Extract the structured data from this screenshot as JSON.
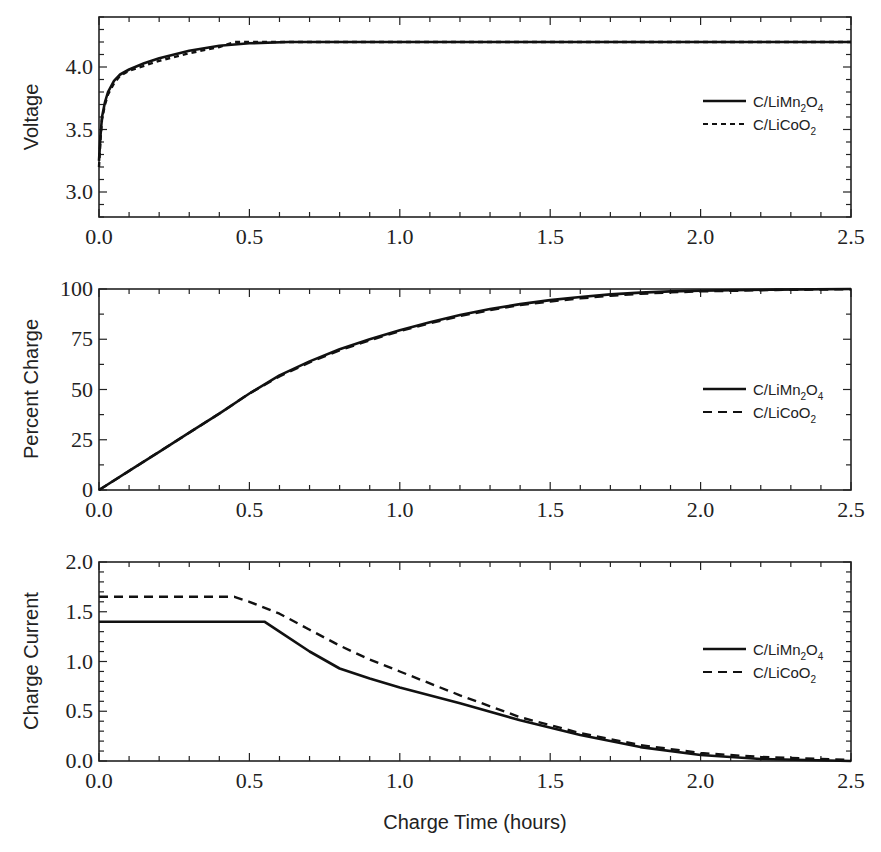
{
  "chart_data": [
    {
      "type": "line",
      "title": "",
      "xlabel": "",
      "ylabel": "Voltage",
      "xlim": [
        0,
        2.5
      ],
      "ylim": [
        2.8,
        4.4
      ],
      "xticks": [
        "0.0",
        "0.5",
        "1.0",
        "1.5",
        "2.0",
        "2.5"
      ],
      "yticks": [
        "3.0",
        "3.5",
        "4.0"
      ],
      "legend_position": "right-center",
      "series": [
        {
          "name": "C/LiMn2O4",
          "style": "solid",
          "x": [
            0,
            0.005,
            0.01,
            0.02,
            0.03,
            0.05,
            0.07,
            0.1,
            0.15,
            0.2,
            0.3,
            0.4,
            0.5,
            0.63,
            1.0,
            1.5,
            2.0,
            2.5
          ],
          "y": [
            3.25,
            3.45,
            3.6,
            3.72,
            3.8,
            3.89,
            3.94,
            3.98,
            4.03,
            4.07,
            4.13,
            4.17,
            4.19,
            4.2,
            4.2,
            4.2,
            4.2,
            4.2
          ]
        },
        {
          "name": "C/LiCoO2",
          "style": "dashed",
          "x": [
            0,
            0.005,
            0.01,
            0.02,
            0.03,
            0.05,
            0.07,
            0.1,
            0.15,
            0.2,
            0.3,
            0.4,
            0.45,
            0.5,
            1.0,
            1.5,
            2.0,
            2.5
          ],
          "y": [
            3.2,
            3.42,
            3.58,
            3.7,
            3.78,
            3.87,
            3.93,
            3.97,
            4.01,
            4.05,
            4.11,
            4.16,
            4.2,
            4.2,
            4.2,
            4.2,
            4.2,
            4.2
          ]
        }
      ]
    },
    {
      "type": "line",
      "title": "",
      "xlabel": "",
      "ylabel": "Percent Charge",
      "xlim": [
        0,
        2.5
      ],
      "ylim": [
        0,
        100
      ],
      "xticks": [
        "0.0",
        "0.5",
        "1.0",
        "1.5",
        "2.0",
        "2.5"
      ],
      "yticks": [
        "0",
        "25",
        "50",
        "75",
        "100"
      ],
      "legend_position": "right-center",
      "series": [
        {
          "name": "C/LiMn2O4",
          "style": "solid",
          "x": [
            0,
            0.1,
            0.2,
            0.3,
            0.4,
            0.5,
            0.6,
            0.7,
            0.8,
            0.9,
            1.0,
            1.1,
            1.2,
            1.3,
            1.4,
            1.5,
            1.6,
            1.7,
            1.8,
            1.9,
            2.0,
            2.25,
            2.5
          ],
          "y": [
            0,
            9.5,
            19,
            28.5,
            38,
            48,
            57,
            64,
            70,
            75,
            79.5,
            83.5,
            87,
            90,
            92.5,
            94.5,
            96,
            97.3,
            98.2,
            98.8,
            99.2,
            99.7,
            100
          ]
        },
        {
          "name": "C/LiCoO2",
          "style": "dashed",
          "x": [
            0,
            0.1,
            0.2,
            0.3,
            0.4,
            0.5,
            0.6,
            0.7,
            0.8,
            0.9,
            1.0,
            1.1,
            1.2,
            1.3,
            1.4,
            1.5,
            1.6,
            1.7,
            1.8,
            1.9,
            2.0,
            2.25,
            2.5
          ],
          "y": [
            0,
            9.5,
            19,
            28.5,
            38,
            48,
            56.5,
            63.5,
            69.5,
            74.5,
            79,
            83,
            86.5,
            89.5,
            92,
            93.8,
            95.3,
            96.6,
            97.6,
            98.3,
            98.8,
            99.5,
            99.9
          ]
        }
      ]
    },
    {
      "type": "line",
      "title": "",
      "xlabel": "Charge Time (hours)",
      "ylabel": "Charge Current",
      "xlim": [
        0,
        2.5
      ],
      "ylim": [
        0,
        2.0
      ],
      "xticks": [
        "0.0",
        "0.5",
        "1.0",
        "1.5",
        "2.0",
        "2.5"
      ],
      "yticks": [
        "0.0",
        "0.5",
        "1.0",
        "1.5",
        "2.0"
      ],
      "legend_position": "right-center",
      "series": [
        {
          "name": "C/LiMn2O4",
          "style": "solid",
          "x": [
            0,
            0.55,
            0.6,
            0.7,
            0.8,
            0.9,
            1.0,
            1.2,
            1.4,
            1.6,
            1.8,
            2.0,
            2.2,
            2.5
          ],
          "y": [
            1.4,
            1.4,
            1.3,
            1.1,
            0.93,
            0.83,
            0.74,
            0.58,
            0.41,
            0.26,
            0.14,
            0.06,
            0.02,
            0.0
          ]
        },
        {
          "name": "C/LiCoO2",
          "style": "dashed",
          "x": [
            0,
            0.45,
            0.5,
            0.6,
            0.7,
            0.8,
            0.9,
            1.0,
            1.2,
            1.4,
            1.6,
            1.8,
            2.0,
            2.2,
            2.5
          ],
          "y": [
            1.65,
            1.65,
            1.6,
            1.48,
            1.32,
            1.16,
            1.02,
            0.9,
            0.66,
            0.44,
            0.28,
            0.16,
            0.08,
            0.04,
            0.01
          ]
        }
      ]
    }
  ],
  "panels": [
    {
      "ylabel": "Voltage",
      "yticks": [
        "3.0",
        "3.5",
        "4.0"
      ]
    },
    {
      "ylabel": "Percent Charge",
      "yticks": [
        "0",
        "25",
        "50",
        "75",
        "100"
      ]
    },
    {
      "ylabel": "Charge Current",
      "yticks": [
        "0.0",
        "0.5",
        "1.0",
        "1.5",
        "2.0"
      ]
    }
  ],
  "xticks": [
    "0.0",
    "0.5",
    "1.0",
    "1.5",
    "2.0",
    "2.5"
  ],
  "xlabel": "Charge Time (hours)",
  "legend": {
    "series1": {
      "prefix": "C/LiMn",
      "sub1": "2",
      "mid": "O",
      "sub2": "4"
    },
    "series2": {
      "prefix": "C/LiCoO",
      "sub1": "2"
    }
  },
  "colors": {
    "line": "#111111",
    "axis": "#222222",
    "background": "#ffffff"
  }
}
